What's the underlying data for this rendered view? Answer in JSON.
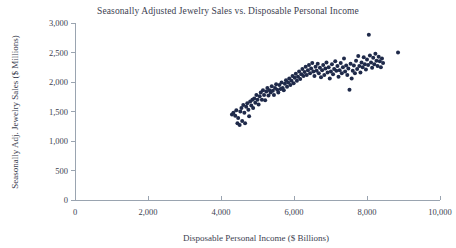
{
  "chart_data": {
    "type": "scatter",
    "title": "Seasonally Adjusted Jewelry Sales vs. Disposable Personal Income",
    "xlabel": "Disposable Personal Income ($ Billions)",
    "ylabel": "Seasonally Adj. Jewelry Sales ($ Millions)",
    "xlim": [
      0,
      10000
    ],
    "ylim": [
      0,
      3000
    ],
    "xticks": [
      0,
      2000,
      4000,
      6000,
      8000,
      10000
    ],
    "yticks": [
      0,
      500,
      1000,
      1500,
      2000,
      2500,
      3000
    ],
    "xticklabels": [
      "0",
      "2,000",
      "4,000",
      "6,000",
      "8,000",
      "10,000"
    ],
    "yticklabels": [
      "0",
      "500",
      "1,000",
      "1,500",
      "2,000",
      "2,500",
      "3,000"
    ],
    "grid": false,
    "legend": false,
    "marker_color": "#1f2a4a",
    "marker_size": 2.0,
    "axis_color": "#9aa4b0",
    "series": [
      {
        "name": "Jewelry Sales",
        "points": [
          [
            4300,
            1450
          ],
          [
            4340,
            1480
          ],
          [
            4390,
            1430
          ],
          [
            4420,
            1520
          ],
          [
            4450,
            1300
          ],
          [
            4470,
            1390
          ],
          [
            4510,
            1270
          ],
          [
            4530,
            1500
          ],
          [
            4560,
            1560
          ],
          [
            4580,
            1340
          ],
          [
            4610,
            1610
          ],
          [
            4640,
            1480
          ],
          [
            4660,
            1300
          ],
          [
            4690,
            1580
          ],
          [
            4720,
            1640
          ],
          [
            4750,
            1530
          ],
          [
            4770,
            1420
          ],
          [
            4800,
            1670
          ],
          [
            4830,
            1600
          ],
          [
            4860,
            1700
          ],
          [
            4880,
            1560
          ],
          [
            4910,
            1720
          ],
          [
            4940,
            1650
          ],
          [
            4970,
            1780
          ],
          [
            5000,
            1700
          ],
          [
            5030,
            1620
          ],
          [
            5060,
            1760
          ],
          [
            5090,
            1820
          ],
          [
            5120,
            1700
          ],
          [
            5150,
            1860
          ],
          [
            5180,
            1780
          ],
          [
            5210,
            1690
          ],
          [
            5240,
            1840
          ],
          [
            5270,
            1900
          ],
          [
            5300,
            1770
          ],
          [
            5330,
            1860
          ],
          [
            5360,
            1820
          ],
          [
            5390,
            1930
          ],
          [
            5420,
            1850
          ],
          [
            5450,
            1780
          ],
          [
            5480,
            1900
          ],
          [
            5510,
            1960
          ],
          [
            5540,
            1870
          ],
          [
            5570,
            1820
          ],
          [
            5600,
            1950
          ],
          [
            5630,
            1880
          ],
          [
            5660,
            1990
          ],
          [
            5690,
            1900
          ],
          [
            5720,
            1860
          ],
          [
            5750,
            1970
          ],
          [
            5780,
            2030
          ],
          [
            5810,
            1920
          ],
          [
            5840,
            1990
          ],
          [
            5870,
            2060
          ],
          [
            5900,
            1950
          ],
          [
            5930,
            2020
          ],
          [
            5960,
            2100
          ],
          [
            5990,
            1980
          ],
          [
            6020,
            2070
          ],
          [
            6050,
            2140
          ],
          [
            6080,
            2020
          ],
          [
            6110,
            2090
          ],
          [
            6140,
            2180
          ],
          [
            6170,
            2050
          ],
          [
            6200,
            2130
          ],
          [
            6230,
            2220
          ],
          [
            6260,
            2100
          ],
          [
            6290,
            2170
          ],
          [
            6320,
            2260
          ],
          [
            6350,
            2120
          ],
          [
            6380,
            2200
          ],
          [
            6410,
            2290
          ],
          [
            6440,
            2150
          ],
          [
            6470,
            2230
          ],
          [
            6500,
            2320
          ],
          [
            6530,
            2180
          ],
          [
            6560,
            2100
          ],
          [
            6590,
            2260
          ],
          [
            6620,
            2190
          ],
          [
            6650,
            2310
          ],
          [
            6680,
            2150
          ],
          [
            6710,
            2240
          ],
          [
            6740,
            2080
          ],
          [
            6770,
            2200
          ],
          [
            6800,
            2290
          ],
          [
            6830,
            2120
          ],
          [
            6860,
            2230
          ],
          [
            6890,
            2330
          ],
          [
            6920,
            2160
          ],
          [
            6950,
            2250
          ],
          [
            6980,
            2060
          ],
          [
            7010,
            2180
          ],
          [
            7040,
            2300
          ],
          [
            7070,
            2130
          ],
          [
            7100,
            2220
          ],
          [
            7130,
            2350
          ],
          [
            7160,
            2190
          ],
          [
            7190,
            2270
          ],
          [
            7220,
            2090
          ],
          [
            7250,
            2200
          ],
          [
            7280,
            2320
          ],
          [
            7310,
            2150
          ],
          [
            7340,
            2250
          ],
          [
            7370,
            2400
          ],
          [
            7400,
            2180
          ],
          [
            7430,
            2280
          ],
          [
            7460,
            2120
          ],
          [
            7490,
            2230
          ],
          [
            7520,
            1870
          ],
          [
            7550,
            2310
          ],
          [
            7580,
            2060
          ],
          [
            7610,
            2190
          ],
          [
            7640,
            2280
          ],
          [
            7670,
            2150
          ],
          [
            7700,
            2360
          ],
          [
            7730,
            2220
          ],
          [
            7760,
            2440
          ],
          [
            7790,
            2270
          ],
          [
            7820,
            2160
          ],
          [
            7850,
            2330
          ],
          [
            7880,
            2250
          ],
          [
            7910,
            2420
          ],
          [
            7940,
            2300
          ],
          [
            7970,
            2210
          ],
          [
            8000,
            2380
          ],
          [
            8030,
            2290
          ],
          [
            8050,
            2800
          ],
          [
            8080,
            2450
          ],
          [
            8110,
            2330
          ],
          [
            8140,
            2240
          ],
          [
            8170,
            2410
          ],
          [
            8200,
            2300
          ],
          [
            8230,
            2480
          ],
          [
            8260,
            2360
          ],
          [
            8290,
            2270
          ],
          [
            8320,
            2430
          ],
          [
            8350,
            2350
          ],
          [
            8380,
            2250
          ],
          [
            8410,
            2400
          ],
          [
            8440,
            2320
          ],
          [
            8850,
            2500
          ]
        ]
      }
    ]
  }
}
